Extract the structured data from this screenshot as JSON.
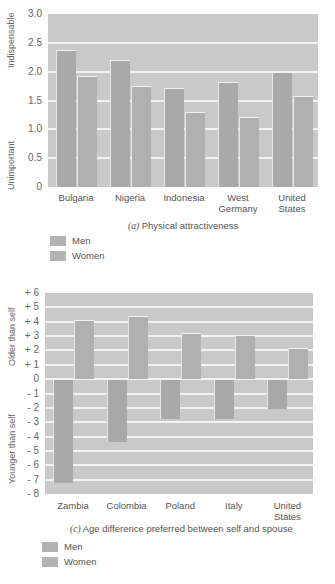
{
  "chart_data": [
    {
      "type": "bar",
      "title": "(a) Physical attractiveness",
      "caption_letter": "(a)",
      "caption_text": "Physical attractiveness",
      "categories": [
        "Bulgaria",
        "Nigeria",
        "Indonesia",
        "West Germany",
        "United States"
      ],
      "category_lines": [
        [
          "Bulgaria"
        ],
        [
          "Nigeria"
        ],
        [
          "Indonesia"
        ],
        [
          "West",
          "Germany"
        ],
        [
          "United",
          "States"
        ]
      ],
      "series": [
        {
          "name": "Men",
          "values": [
            2.38,
            2.2,
            1.72,
            1.82,
            2.0
          ]
        },
        {
          "name": "Women",
          "values": [
            1.92,
            1.75,
            1.3,
            1.22,
            1.57
          ]
        }
      ],
      "xlabel": "",
      "ylabel_top": "Indispensable",
      "ylabel_bottom": "Unimportant",
      "yticks": [
        "3.0",
        "2.5",
        "2.0",
        "1.5",
        "1.0",
        "0.5",
        "0"
      ],
      "ylim": [
        0,
        3.0
      ],
      "grid": true,
      "legend": [
        "Men",
        "Women"
      ],
      "legend_position": "bottom-left"
    },
    {
      "type": "bar",
      "title": "(c) Age difference preferred between self and spouse",
      "caption_letter": "(c)",
      "caption_text": "Age difference preferred between self and spouse",
      "categories": [
        "Zambia",
        "Colombia",
        "Poland",
        "Italy",
        "United States"
      ],
      "category_lines": [
        [
          "Zambia"
        ],
        [
          "Colombia"
        ],
        [
          "Poland"
        ],
        [
          "Italy"
        ],
        [
          "United",
          "States"
        ]
      ],
      "series": [
        {
          "name": "Men",
          "values": [
            -7.2,
            -4.4,
            -2.8,
            -2.8,
            -2.1
          ]
        },
        {
          "name": "Women",
          "values": [
            4.1,
            4.4,
            3.2,
            3.1,
            2.2
          ]
        }
      ],
      "xlabel": "",
      "ylabel_top": "Older than self",
      "ylabel_bottom": "Younger than self",
      "yticks": [
        "+ 6",
        "+ 5",
        "+ 4",
        "+ 3",
        "+ 2",
        "+ 1",
        "0",
        "- 1",
        "- 2",
        "- 3",
        "- 4",
        "- 5",
        "- 6",
        "- 7",
        "- 8"
      ],
      "ylim": [
        -8,
        6
      ],
      "grid": true,
      "legend": [
        "Men",
        "Women"
      ],
      "legend_position": "bottom-left"
    }
  ],
  "colors": {
    "plot_bg": "#c9c9c9",
    "gridline": "#f2f2f2",
    "men": "#a9a9a9",
    "women": "#b0b0b0"
  }
}
